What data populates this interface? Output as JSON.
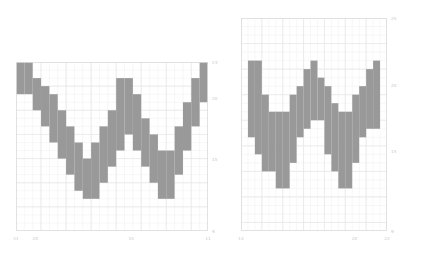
{
  "figure": {
    "background_color": "#ffffff",
    "width": 421,
    "height": 257,
    "panel_count": 2
  },
  "style": {
    "fill_color": "#999999",
    "grid_color": "#e8e8e8",
    "grid_minor_color": "#f2f2f2",
    "spine_color": "#dddddd",
    "tick_label_color": "#c8c8c8"
  },
  "chart_data": [
    {
      "id": "left-panel",
      "type": "heatmap",
      "title": "",
      "xlabel": "",
      "ylabel": "",
      "grid": true,
      "legend_position": "none",
      "xlim": [
        21,
        11
      ],
      "ylim": [
        9,
        23
      ],
      "xticks": [
        21,
        20,
        15,
        11
      ],
      "xticklabels": [
        "21",
        "20",
        "15",
        "11"
      ],
      "yticks": [
        23,
        20,
        15,
        9
      ],
      "yticklabels": [
        "23",
        "20",
        "15",
        "9"
      ],
      "ytick_side": "right",
      "ncols": 23,
      "nrows": 21,
      "description": "Pixelated letter W rendered as filled grid cells",
      "filled_columns": [
        {
          "col": 1,
          "top": 1,
          "bottom": 4
        },
        {
          "col": 2,
          "top": 1,
          "bottom": 4
        },
        {
          "col": 3,
          "top": 3,
          "bottom": 6
        },
        {
          "col": 4,
          "top": 4,
          "bottom": 8
        },
        {
          "col": 5,
          "top": 5,
          "bottom": 10
        },
        {
          "col": 6,
          "top": 7,
          "bottom": 12
        },
        {
          "col": 7,
          "top": 9,
          "bottom": 14
        },
        {
          "col": 8,
          "top": 11,
          "bottom": 16
        },
        {
          "col": 9,
          "top": 13,
          "bottom": 17
        },
        {
          "col": 10,
          "top": 11,
          "bottom": 17
        },
        {
          "col": 11,
          "top": 9,
          "bottom": 15
        },
        {
          "col": 12,
          "top": 7,
          "bottom": 13
        },
        {
          "col": 13,
          "top": 3,
          "bottom": 11
        },
        {
          "col": 14,
          "top": 3,
          "bottom": 9
        },
        {
          "col": 15,
          "top": 5,
          "bottom": 11
        },
        {
          "col": 16,
          "top": 8,
          "bottom": 13
        },
        {
          "col": 17,
          "top": 10,
          "bottom": 15
        },
        {
          "col": 18,
          "top": 12,
          "bottom": 17
        },
        {
          "col": 19,
          "top": 12,
          "bottom": 17
        },
        {
          "col": 20,
          "top": 9,
          "bottom": 14
        },
        {
          "col": 21,
          "top": 6,
          "bottom": 11
        },
        {
          "col": 22,
          "top": 3,
          "bottom": 8
        },
        {
          "col": 23,
          "top": 1,
          "bottom": 5
        }
      ]
    },
    {
      "id": "right-panel",
      "type": "heatmap",
      "title": "",
      "xlabel": "",
      "ylabel": "",
      "grid": true,
      "legend_position": "none",
      "xlim": [
        13,
        22
      ],
      "ylim": [
        9,
        25
      ],
      "xticks": [
        13,
        20,
        22
      ],
      "xticklabels": [
        "13",
        "20",
        "22"
      ],
      "yticks": [
        25,
        20,
        15,
        9
      ],
      "yticklabels": [
        "25",
        "20",
        "15",
        "9"
      ],
      "ytick_side": "right",
      "ncols": 21,
      "nrows": 25,
      "description": "Pixelated letter W rendered as filled grid cells",
      "filled_columns": [
        {
          "col": 2,
          "top": 6,
          "bottom": 14
        },
        {
          "col": 3,
          "top": 6,
          "bottom": 16
        },
        {
          "col": 4,
          "top": 10,
          "bottom": 18
        },
        {
          "col": 5,
          "top": 12,
          "bottom": 18
        },
        {
          "col": 6,
          "top": 12,
          "bottom": 20
        },
        {
          "col": 7,
          "top": 12,
          "bottom": 20
        },
        {
          "col": 8,
          "top": 10,
          "bottom": 17
        },
        {
          "col": 9,
          "top": 9,
          "bottom": 14
        },
        {
          "col": 10,
          "top": 7,
          "bottom": 13
        },
        {
          "col": 11,
          "top": 6,
          "bottom": 12
        },
        {
          "col": 12,
          "top": 8,
          "bottom": 12
        },
        {
          "col": 13,
          "top": 9,
          "bottom": 16
        },
        {
          "col": 14,
          "top": 11,
          "bottom": 18
        },
        {
          "col": 15,
          "top": 12,
          "bottom": 20
        },
        {
          "col": 16,
          "top": 12,
          "bottom": 20
        },
        {
          "col": 17,
          "top": 10,
          "bottom": 17
        },
        {
          "col": 18,
          "top": 9,
          "bottom": 14
        },
        {
          "col": 19,
          "top": 7,
          "bottom": 13
        },
        {
          "col": 20,
          "top": 6,
          "bottom": 13
        }
      ]
    }
  ]
}
